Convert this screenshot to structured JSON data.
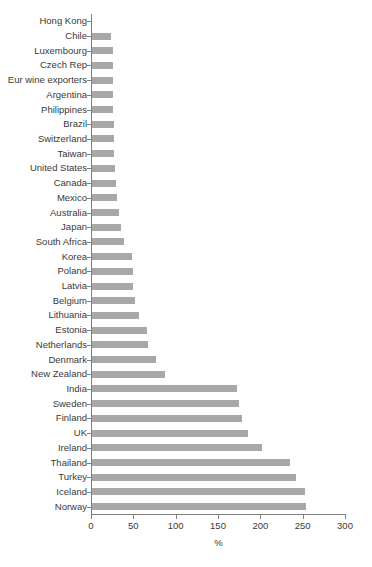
{
  "chart_data": {
    "type": "bar",
    "orientation": "horizontal",
    "title": "",
    "subtitle": "",
    "xlabel": "%",
    "ylabel": "",
    "xlim": [
      0,
      300
    ],
    "xticks": [
      0,
      50,
      100,
      150,
      200,
      250,
      300
    ],
    "xtick_labels": [
      "0",
      "50",
      "100",
      "150",
      "200",
      "250",
      "300"
    ],
    "grid": false,
    "legend": false,
    "bar_color": "#a8a8a8",
    "axis_color": "#7f7f7f",
    "text_color": "#3a3a3a",
    "categories": [
      "Hong Kong",
      "Chile",
      "Luxembourg",
      "Czech Rep",
      "Eur wine exporters",
      "Argentina",
      "Philippines",
      "Brazil",
      "Switzerland",
      "Taiwan",
      "United States",
      "Canada",
      "Mexico",
      "Australia",
      "Japan",
      "South Africa",
      "Korea",
      "Poland",
      "Latvia",
      "Belgium",
      "Lithuania",
      "Estonia",
      "Netherlands",
      "Denmark",
      "New Zealand",
      "India",
      "Sweden",
      "Finland",
      "UK",
      "Ireland",
      "Thailand",
      "Turkey",
      "Iceland",
      "Norway"
    ],
    "values": [
      0,
      22,
      25,
      25,
      25,
      25,
      25,
      26,
      26,
      26,
      27,
      28,
      30,
      32,
      34,
      38,
      47,
      48,
      48,
      51,
      55,
      65,
      66,
      75,
      86,
      171,
      174,
      177,
      184,
      201,
      234,
      241,
      252,
      253
    ]
  }
}
